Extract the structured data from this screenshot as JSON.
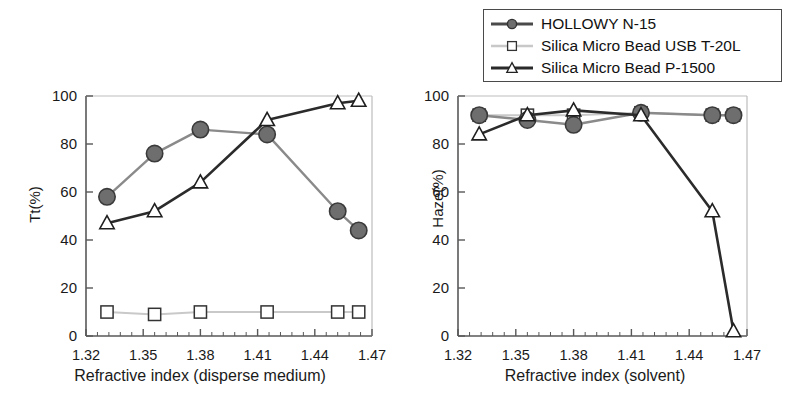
{
  "figure": {
    "background": "#ffffff",
    "axis_color": "#555555",
    "text_color": "#1a1a1a"
  },
  "legend": {
    "position": "top-right",
    "border_color": "#4a4a4a",
    "entries": [
      {
        "label": "HOLLOWY N-15",
        "marker": "filled-circle",
        "color": "#4f4f4f",
        "marker_fill": "#6e6e6e",
        "line_color": "#7d7d7d"
      },
      {
        "label": "Silica Micro Bead USB T-20L",
        "marker": "open-square",
        "color": "#333333",
        "marker_fill": "#ffffff",
        "line_color": "#bdbdbd"
      },
      {
        "label": "Silica Micro Bead P-1500",
        "marker": "open-triangle",
        "color": "#2a2a2a",
        "marker_fill": "#ffffff",
        "line_color": "#2a2a2a"
      }
    ]
  },
  "chart_data": [
    {
      "type": "line",
      "id": "tt-chart",
      "title": "",
      "xlabel": "Refractive index (disperse medium)",
      "ylabel": "Tt(%)",
      "xlim": [
        1.32,
        1.47
      ],
      "ylim": [
        0,
        100
      ],
      "xticks": [
        "1.32",
        "1.35",
        "1.38",
        "1.41",
        "1.44",
        "1.47"
      ],
      "xtick_values": [
        1.32,
        1.35,
        1.38,
        1.41,
        1.44,
        1.47
      ],
      "yticks": [
        "0",
        "20",
        "40",
        "60",
        "80",
        "100"
      ],
      "ytick_values": [
        0,
        20,
        40,
        60,
        80,
        100
      ],
      "grid": false,
      "minor_ticks": true,
      "x": [
        1.331,
        1.356,
        1.38,
        1.415,
        1.452,
        1.463
      ],
      "series": [
        {
          "name": "HOLLOWY N-15",
          "marker": "filled-circle",
          "values": [
            58,
            76,
            86,
            84,
            52,
            44
          ]
        },
        {
          "name": "Silica Micro Bead USB T-20L",
          "marker": "open-square",
          "values": [
            10,
            9,
            10,
            10,
            10,
            10
          ]
        },
        {
          "name": "Silica Micro Bead P-1500",
          "marker": "open-triangle",
          "values": [
            47,
            52,
            64,
            90,
            97,
            98
          ]
        }
      ]
    },
    {
      "type": "line",
      "id": "haze-chart",
      "title": "",
      "xlabel": "Refractive index (solvent)",
      "ylabel": "Haze(%)",
      "xlim": [
        1.32,
        1.47
      ],
      "ylim": [
        0,
        100
      ],
      "xticks": [
        "1.32",
        "1.35",
        "1.38",
        "1.41",
        "1.44",
        "1.47"
      ],
      "xtick_values": [
        1.32,
        1.35,
        1.38,
        1.41,
        1.44,
        1.47
      ],
      "yticks": [
        "0",
        "20",
        "40",
        "60",
        "80",
        "100"
      ],
      "ytick_values": [
        0,
        20,
        40,
        60,
        80,
        100
      ],
      "grid": false,
      "minor_ticks": true,
      "x": [
        1.331,
        1.356,
        1.38,
        1.415,
        1.452,
        1.463
      ],
      "series": [
        {
          "name": "HOLLOWY N-15",
          "marker": "filled-circle",
          "values": [
            92,
            90,
            88,
            93,
            92,
            92
          ]
        },
        {
          "name": "Silica Micro Bead USB T-20L",
          "marker": "open-square",
          "values": [
            92,
            92,
            92,
            93,
            92,
            92
          ]
        },
        {
          "name": "Silica Micro Bead P-1500",
          "marker": "open-triangle",
          "values": [
            84,
            92,
            94,
            92,
            52,
            2
          ]
        }
      ]
    }
  ]
}
